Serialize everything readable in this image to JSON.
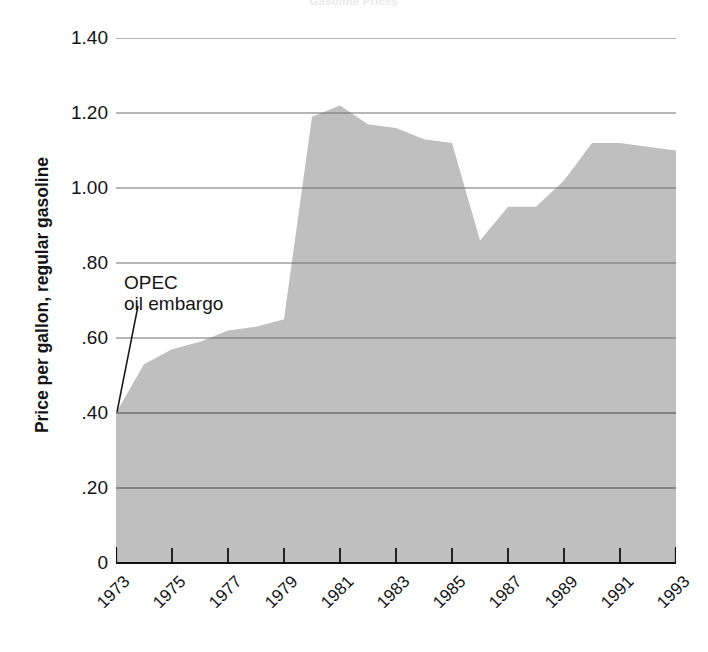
{
  "chart_data": {
    "type": "area",
    "title": "Gasoline Prices",
    "xlabel": "",
    "ylabel": "Price per gallon, regular gasoline",
    "ylim": [
      0,
      1.45
    ],
    "xlim": [
      1973,
      1993
    ],
    "grid": true,
    "legend": "none",
    "fill_color": "#bfbfbf",
    "grid_color": "#6e6e6e",
    "axis_color": "#111111",
    "x": [
      1973,
      1974,
      1975,
      1976,
      1977,
      1978,
      1979,
      1980,
      1981,
      1982,
      1983,
      1984,
      1985,
      1986,
      1987,
      1988,
      1989,
      1990,
      1991,
      1992,
      1993
    ],
    "values": [
      0.4,
      0.53,
      0.57,
      0.59,
      0.62,
      0.63,
      0.65,
      1.19,
      1.22,
      1.17,
      1.16,
      1.13,
      1.12,
      0.86,
      0.95,
      0.95,
      1.02,
      1.12,
      1.12,
      1.11,
      1.1
    ],
    "y_tick_values": [
      1.4,
      1.2,
      1.0,
      0.8,
      0.6,
      0.4,
      0.2,
      0
    ],
    "y_tick_labels": [
      "1.40",
      "1.20",
      "1.00",
      ".80",
      ".60",
      ".40",
      ".20",
      "0"
    ],
    "x_tick_values": [
      1973,
      1975,
      1977,
      1979,
      1981,
      1983,
      1985,
      1987,
      1989,
      1991,
      1993
    ],
    "x_tick_labels": [
      "1973",
      "1975",
      "1977",
      "1979",
      "1981",
      "1983",
      "1985",
      "1987",
      "1989",
      "1991",
      "1993"
    ],
    "annotations": [
      {
        "line1": "OPEC",
        "line2": "oil embargo",
        "points_to_x": 1973,
        "points_to_y": 0.4
      }
    ]
  }
}
